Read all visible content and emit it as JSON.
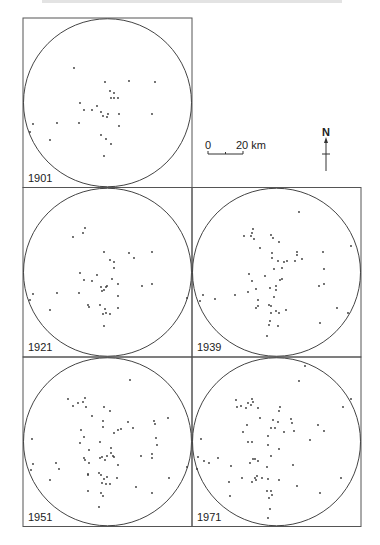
{
  "figure": {
    "frame_color": "#555555",
    "circle_color": "#444444",
    "dot_color": "#333333"
  },
  "scale_bar": {
    "start_label": "0",
    "end_label": "20 km"
  },
  "north_arrow": {
    "label": "N"
  },
  "panels": [
    {
      "year": "1901",
      "col": 0,
      "row": 0,
      "dots": [
        [
          74,
          68
        ],
        [
          105,
          82
        ],
        [
          129,
          81
        ],
        [
          155,
          82
        ],
        [
          110,
          91
        ],
        [
          114,
          93
        ],
        [
          111,
          98
        ],
        [
          114,
          98
        ],
        [
          118,
          98
        ],
        [
          80,
          103
        ],
        [
          84,
          110
        ],
        [
          97,
          106
        ],
        [
          92,
          110
        ],
        [
          101,
          112
        ],
        [
          103,
          116
        ],
        [
          107,
          117
        ],
        [
          108,
          114
        ],
        [
          119,
          114
        ],
        [
          119,
          126
        ],
        [
          33,
          124
        ],
        [
          57,
          123
        ],
        [
          79,
          123
        ],
        [
          50,
          140
        ],
        [
          101,
          135
        ],
        [
          106,
          139
        ],
        [
          111,
          144
        ],
        [
          104,
          156
        ],
        [
          152,
          114
        ],
        [
          30,
          132
        ]
      ]
    },
    {
      "year": "1921",
      "col": 0,
      "row": 1,
      "dots": [
        [
          85,
          228
        ],
        [
          83,
          233
        ],
        [
          73,
          237
        ],
        [
          104,
          252
        ],
        [
          129,
          253
        ],
        [
          134,
          258
        ],
        [
          152,
          252
        ],
        [
          110,
          260
        ],
        [
          114,
          262
        ],
        [
          114,
          268
        ],
        [
          80,
          273
        ],
        [
          97,
          275
        ],
        [
          84,
          280
        ],
        [
          92,
          281
        ],
        [
          112,
          279
        ],
        [
          118,
          284
        ],
        [
          107,
          286
        ],
        [
          101,
          287
        ],
        [
          104,
          290
        ],
        [
          102,
          291
        ],
        [
          106,
          287
        ],
        [
          142,
          286
        ],
        [
          152,
          284
        ],
        [
          79,
          293
        ],
        [
          57,
          293
        ],
        [
          33,
          294
        ],
        [
          30,
          300
        ],
        [
          118,
          296
        ],
        [
          100,
          305
        ],
        [
          88,
          305
        ],
        [
          89,
          307
        ],
        [
          105,
          309
        ],
        [
          118,
          308
        ],
        [
          50,
          310
        ],
        [
          103,
          314
        ],
        [
          106,
          313
        ],
        [
          110,
          314
        ],
        [
          104,
          326
        ]
      ]
    },
    {
      "year": "1939",
      "col": 1,
      "row": 1,
      "dots": [
        [
          299,
          212
        ],
        [
          253,
          229
        ],
        [
          252,
          233
        ],
        [
          244,
          236
        ],
        [
          251,
          236
        ],
        [
          254,
          239
        ],
        [
          271,
          235
        ],
        [
          273,
          238
        ],
        [
          279,
          242
        ],
        [
          260,
          248
        ],
        [
          297,
          252
        ],
        [
          297,
          255
        ],
        [
          323,
          252
        ],
        [
          272,
          253
        ],
        [
          272,
          258
        ],
        [
          302,
          259
        ],
        [
          278,
          261
        ],
        [
          284,
          262
        ],
        [
          287,
          261
        ],
        [
          295,
          261
        ],
        [
          324,
          269
        ],
        [
          274,
          269
        ],
        [
          282,
          268
        ],
        [
          249,
          274
        ],
        [
          252,
          281
        ],
        [
          265,
          276
        ],
        [
          280,
          280
        ],
        [
          282,
          279
        ],
        [
          319,
          286
        ],
        [
          324,
          284
        ],
        [
          276,
          286
        ],
        [
          270,
          288
        ],
        [
          276,
          290
        ],
        [
          256,
          289
        ],
        [
          235,
          295
        ],
        [
          248,
          292
        ],
        [
          274,
          297
        ],
        [
          203,
          295
        ],
        [
          200,
          301
        ],
        [
          215,
          299
        ],
        [
          258,
          300
        ],
        [
          187,
          298
        ],
        [
          256,
          308
        ],
        [
          258,
          306
        ],
        [
          269,
          305
        ],
        [
          271,
          306
        ],
        [
          286,
          310
        ],
        [
          276,
          311
        ],
        [
          271,
          313
        ],
        [
          279,
          313
        ],
        [
          337,
          308
        ],
        [
          270,
          321
        ],
        [
          278,
          326
        ],
        [
          269,
          325
        ],
        [
          267,
          336
        ],
        [
          320,
          323
        ],
        [
          351,
          246
        ],
        [
          348,
          313
        ]
      ]
    },
    {
      "year": "1951",
      "col": 0,
      "row": 2,
      "dots": [
        [
          130,
          380
        ],
        [
          68,
          399
        ],
        [
          85,
          398
        ],
        [
          78,
          403
        ],
        [
          83,
          402
        ],
        [
          86,
          407
        ],
        [
          73,
          406
        ],
        [
          104,
          407
        ],
        [
          110,
          411
        ],
        [
          92,
          416
        ],
        [
          103,
          421
        ],
        [
          128,
          422
        ],
        [
          103,
          427
        ],
        [
          118,
          430
        ],
        [
          121,
          429
        ],
        [
          133,
          428
        ],
        [
          154,
          421
        ],
        [
          168,
          418
        ],
        [
          155,
          424
        ],
        [
          114,
          433
        ],
        [
          81,
          430
        ],
        [
          84,
          437
        ],
        [
          156,
          438
        ],
        [
          80,
          443
        ],
        [
          157,
          445
        ],
        [
          111,
          448
        ],
        [
          89,
          450
        ],
        [
          111,
          453
        ],
        [
          114,
          457
        ],
        [
          107,
          456
        ],
        [
          100,
          458
        ],
        [
          102,
          457
        ],
        [
          113,
          456
        ],
        [
          105,
          460
        ],
        [
          84,
          458
        ],
        [
          85,
          460
        ],
        [
          89,
          463
        ],
        [
          141,
          456
        ],
        [
          152,
          454
        ],
        [
          152,
          458
        ],
        [
          118,
          465
        ],
        [
          56,
          463
        ],
        [
          33,
          464
        ],
        [
          59,
          469
        ],
        [
          31,
          470
        ],
        [
          88,
          474
        ],
        [
          88,
          475
        ],
        [
          99,
          473
        ],
        [
          101,
          475
        ],
        [
          107,
          477
        ],
        [
          104,
          479
        ],
        [
          117,
          478
        ],
        [
          102,
          483
        ],
        [
          106,
          484
        ],
        [
          110,
          484
        ],
        [
          50,
          480
        ],
        [
          88,
          491
        ],
        [
          101,
          493
        ],
        [
          103,
          496
        ],
        [
          169,
          478
        ],
        [
          136,
          487
        ],
        [
          152,
          493
        ],
        [
          99,
          507
        ],
        [
          32,
          439
        ],
        [
          100,
          442
        ]
      ]
    },
    {
      "year": "1971",
      "col": 1,
      "row": 2,
      "dots": [
        [
          305,
          366
        ],
        [
          299,
          381
        ],
        [
          236,
          400
        ],
        [
          252,
          399
        ],
        [
          253,
          402
        ],
        [
          248,
          403
        ],
        [
          251,
          405
        ],
        [
          241,
          406
        ],
        [
          246,
          408
        ],
        [
          258,
          408
        ],
        [
          237,
          407
        ],
        [
          280,
          407
        ],
        [
          279,
          411
        ],
        [
          260,
          418
        ],
        [
          273,
          420
        ],
        [
          278,
          422
        ],
        [
          247,
          425
        ],
        [
          292,
          423
        ],
        [
          271,
          428
        ],
        [
          275,
          428
        ],
        [
          291,
          419
        ],
        [
          284,
          432
        ],
        [
          294,
          431
        ],
        [
          243,
          432
        ],
        [
          268,
          436
        ],
        [
          201,
          439
        ],
        [
          318,
          425
        ],
        [
          324,
          431
        ],
        [
          248,
          442
        ],
        [
          268,
          445
        ],
        [
          252,
          442
        ],
        [
          310,
          440
        ],
        [
          279,
          449
        ],
        [
          253,
          459
        ],
        [
          271,
          456
        ],
        [
          255,
          459
        ],
        [
          250,
          463
        ],
        [
          258,
          461
        ],
        [
          218,
          458
        ],
        [
          204,
          461
        ],
        [
          209,
          463
        ],
        [
          197,
          469
        ],
        [
          293,
          465
        ],
        [
          231,
          466
        ],
        [
          267,
          467
        ],
        [
          262,
          478
        ],
        [
          255,
          478
        ],
        [
          256,
          480
        ],
        [
          257,
          476
        ],
        [
          242,
          478
        ],
        [
          252,
          482
        ],
        [
          268,
          479
        ],
        [
          279,
          480
        ],
        [
          297,
          486
        ],
        [
          320,
          493
        ],
        [
          341,
          478
        ],
        [
          230,
          496
        ],
        [
          269,
          498
        ],
        [
          271,
          491
        ],
        [
          272,
          495
        ],
        [
          267,
          491
        ],
        [
          229,
          482
        ],
        [
          270,
          509
        ],
        [
          268,
          518
        ],
        [
          343,
          407
        ],
        [
          351,
          399
        ],
        [
          187,
          467
        ],
        [
          198,
          457
        ]
      ]
    }
  ]
}
